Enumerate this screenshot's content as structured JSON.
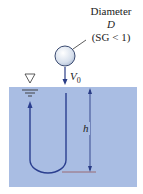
{
  "diagram": {
    "labels": {
      "diameter_word": "Diameter",
      "diameter_symbol": "D",
      "specific_gravity": "(SG < 1)",
      "velocity": "V",
      "velocity_subscript": "0",
      "depth": "h"
    },
    "icons": {
      "free_surface": "inverted-triangle-water-level"
    },
    "colors": {
      "water": "#a9bde3",
      "path": "#2b3f8f",
      "arrow": "#2a3d86",
      "sphere_fill": "#dfe7f2",
      "sphere_stroke": "#3a4a70",
      "bottom_line": "#9a6b74",
      "text": "#222222"
    }
  }
}
